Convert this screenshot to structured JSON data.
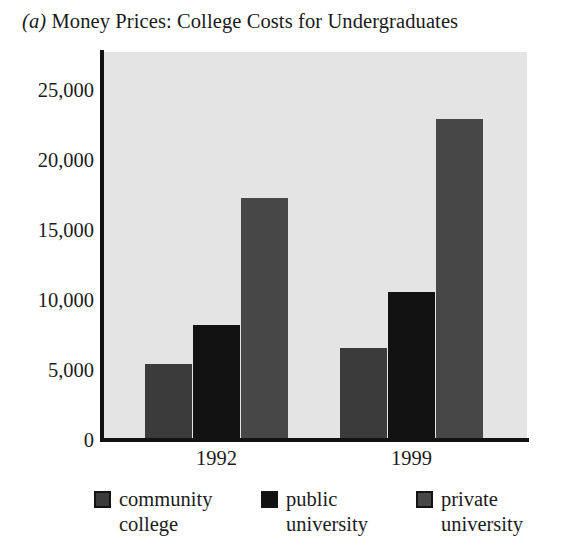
{
  "figure": {
    "panel_letter": "(a)",
    "title": "Money Prices: College Costs for Undergraduates"
  },
  "colors": {
    "plot_background": "#e4e4e4",
    "axis": "#121212",
    "community_college": "#3b3b3b",
    "public_university": "#121212",
    "private_university": "#474747",
    "text": "#1b1b1b"
  },
  "axis": {
    "y_ticks": [
      "0",
      "5,000",
      "10,000",
      "15,000",
      "20,000",
      "25,000"
    ],
    "x_labels": [
      "1992",
      "1999"
    ]
  },
  "legend": {
    "items": [
      {
        "label": "community\ncollege",
        "swatch": "community-college-swatch"
      },
      {
        "label": "public\nuniversity",
        "swatch": "public-university-swatch"
      },
      {
        "label": "private\nuniversity",
        "swatch": "private-university-swatch"
      }
    ]
  },
  "chart_data": {
    "type": "bar",
    "title": "(a) Money Prices: College Costs for Undergraduates",
    "xlabel": "",
    "ylabel": "",
    "categories": [
      "1992",
      "1999"
    ],
    "series": [
      {
        "name": "community college",
        "values": [
          5400,
          6600
        ],
        "color": "#3b3b3b"
      },
      {
        "name": "public university",
        "values": [
          8200,
          10600
        ],
        "color": "#121212"
      },
      {
        "name": "private university",
        "values": [
          17300,
          22900
        ],
        "color": "#474747"
      }
    ],
    "ylim": [
      0,
      27800
    ],
    "ytick_values": [
      0,
      5000,
      10000,
      15000,
      20000,
      25000
    ],
    "grid": false,
    "legend_position": "bottom"
  }
}
